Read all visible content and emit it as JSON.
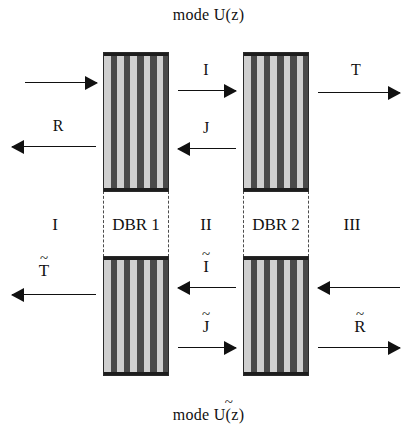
{
  "figure": {
    "caption_top": "mode U(z)",
    "caption_bottom_prefix": "mode ",
    "caption_bottom_base": "U(z)",
    "tilde_mark": "~"
  },
  "structures": {
    "dbr1_label": "DBR 1",
    "dbr2_label": "DBR 2",
    "stripe_light_color": "#cfcfcf",
    "stripe_dark_color": "#4a4a4a",
    "outline_color": "#2a2a2a",
    "dashed_color": "#4c4c4c",
    "stripe_pairs": 5
  },
  "regions": {
    "left": "I",
    "middle": "II",
    "right": "III"
  },
  "amplitudes": {
    "incident_top_left": "",
    "reflected_top_left": "R",
    "cavity_forward": "I",
    "cavity_backward": "J",
    "transmitted_top_right": "T",
    "transmitted_bottom_left": "T",
    "cavity_backward_lower": "I",
    "cavity_forward_lower": "J",
    "incident_bottom_right": "",
    "reflected_bottom_right": "R"
  },
  "colors": {
    "background": "#ffffff",
    "ink": "#111111"
  }
}
